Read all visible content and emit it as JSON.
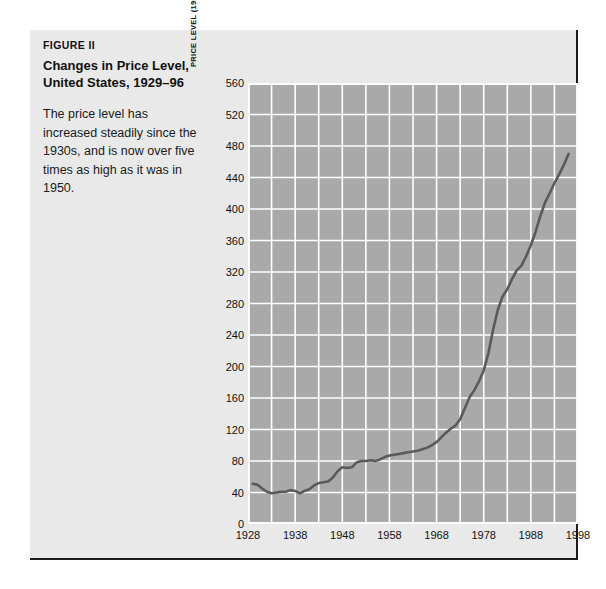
{
  "figure": {
    "number": "FIGURE II",
    "title": "Changes in Price Level, United States, 1929–96",
    "description": "The price level has increased steadily since the 1930s, and is now over five times as high as it was in 1950."
  },
  "colors": {
    "page_background": "#ffffff",
    "panel_background": "#e9e9e9",
    "panel_border": "#1c1c1c",
    "plot_background": "#a9a9a9",
    "gridline": "#ffffff",
    "data_line": "#5a5a5a",
    "text": "#111111"
  },
  "chart_data": {
    "type": "line",
    "title": "Changes in Price Level, United States, 1929–96",
    "xlabel": "",
    "ylabel": "PRICE LEVEL (1958 = 100)",
    "xlim": [
      1928,
      1998
    ],
    "ylim": [
      0,
      560
    ],
    "grid": true,
    "legend": "none",
    "x_ticks": [
      1928,
      1938,
      1948,
      1958,
      1968,
      1978,
      1988,
      1998
    ],
    "x_minor_ticks": [
      1933,
      1943,
      1953,
      1963,
      1973,
      1983,
      1993
    ],
    "y_ticks": [
      0,
      40,
      80,
      120,
      160,
      200,
      240,
      280,
      320,
      360,
      400,
      440,
      480,
      520,
      560
    ],
    "series": [
      {
        "name": "Price level (1958 = 100)",
        "x": [
          1929,
          1930,
          1931,
          1932,
          1933,
          1934,
          1935,
          1936,
          1937,
          1938,
          1939,
          1940,
          1941,
          1942,
          1943,
          1944,
          1945,
          1946,
          1947,
          1948,
          1949,
          1950,
          1951,
          1952,
          1953,
          1954,
          1955,
          1956,
          1957,
          1958,
          1959,
          1960,
          1961,
          1962,
          1963,
          1964,
          1965,
          1966,
          1967,
          1968,
          1969,
          1970,
          1971,
          1972,
          1973,
          1974,
          1975,
          1976,
          1977,
          1978,
          1979,
          1980,
          1981,
          1982,
          1983,
          1984,
          1985,
          1986,
          1987,
          1988,
          1989,
          1990,
          1991,
          1992,
          1993,
          1994,
          1995,
          1996
        ],
        "values": [
          51,
          50,
          45,
          41,
          39,
          40,
          41,
          41,
          43,
          42,
          39,
          42,
          44,
          49,
          52,
          53,
          54,
          59,
          67,
          72,
          71,
          72,
          78,
          80,
          80,
          81,
          80,
          82,
          85,
          87,
          88,
          89,
          90,
          91,
          92,
          93,
          95,
          97,
          100,
          104,
          110,
          116,
          121,
          125,
          133,
          147,
          161,
          170,
          181,
          195,
          217,
          247,
          272,
          289,
          298,
          311,
          322,
          328,
          340,
          354,
          371,
          391,
          408,
          420,
          433,
          444,
          456,
          470
        ],
        "color": "#5a5a5a",
        "line_width": 2.6
      }
    ]
  }
}
